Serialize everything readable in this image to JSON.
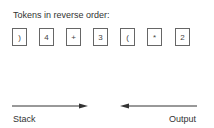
{
  "title": "Tokens in reverse order:",
  "tokens": [
    ")",
    "4",
    "+",
    "3",
    "(",
    "*",
    "2"
  ],
  "labels": {
    "stack": "Stack",
    "output": "Output"
  },
  "colors": {
    "line": "#333333",
    "box_border": "#666666",
    "text": "#333333"
  }
}
